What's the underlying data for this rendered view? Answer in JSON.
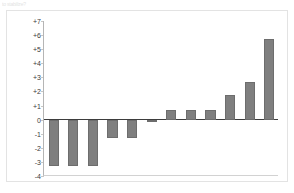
{
  "scan": {
    "fragment_text": "to stabilize?"
  },
  "figure": {
    "title_line1": "Days to ship relative to (plus or minus) the",
    "title_line2": "mean baseline value (black line) of 4.25",
    "bar_color": "#7f7f7f",
    "baseline_color": "#3d3d3d",
    "axis_color": "#b5b5b5"
  },
  "chart_data": {
    "type": "bar",
    "title": "Days to ship relative to (plus or minus) the mean baseline value (black line) of 4.25",
    "xlabel": "",
    "ylabel": "",
    "ylim": [
      -4,
      7
    ],
    "grid": false,
    "legend": "none",
    "baseline": 0,
    "baseline_note": "mean baseline value of 4.25",
    "ytick_labels": [
      "+7",
      "+6",
      "+5",
      "+4",
      "+3",
      "+2",
      "+1",
      "0",
      "-1",
      "-2",
      "-3",
      "-4"
    ],
    "ytick_values": [
      7,
      6,
      5,
      4,
      3,
      2,
      1,
      0,
      -1,
      -2,
      -3,
      -4
    ],
    "categories": [
      "1",
      "2",
      "3",
      "4",
      "5",
      "6",
      "7",
      "8",
      "9",
      "10",
      "11",
      "12"
    ],
    "values": [
      -3.3,
      -3.3,
      -3.3,
      -1.3,
      -1.3,
      -0.2,
      0.7,
      0.7,
      0.7,
      1.75,
      2.7,
      5.7
    ]
  }
}
